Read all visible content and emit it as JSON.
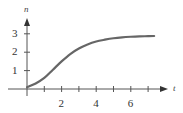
{
  "chart_data": {
    "type": "line",
    "title": "",
    "xlabel": "t",
    "ylabel": "n",
    "xlim": [
      0,
      7.5
    ],
    "ylim": [
      0,
      3.2
    ],
    "x_ticks": [
      1,
      2,
      3,
      4,
      5,
      6,
      7
    ],
    "x_tick_labels": [
      "2",
      "4",
      "6"
    ],
    "y_ticks": [
      1,
      2,
      3
    ],
    "y_tick_labels": [
      "1",
      "2",
      "3"
    ],
    "grid": false,
    "legend": null,
    "series": [
      {
        "name": "n(t)",
        "color": "#666666",
        "x": [
          0,
          0.5,
          1,
          1.5,
          2,
          2.5,
          3,
          3.5,
          4,
          4.5,
          5,
          5.5,
          6,
          6.5,
          7,
          7.35
        ],
        "y": [
          0.1,
          0.3,
          0.6,
          1.05,
          1.5,
          1.9,
          2.2,
          2.42,
          2.58,
          2.68,
          2.76,
          2.81,
          2.84,
          2.86,
          2.87,
          2.88
        ]
      }
    ]
  }
}
